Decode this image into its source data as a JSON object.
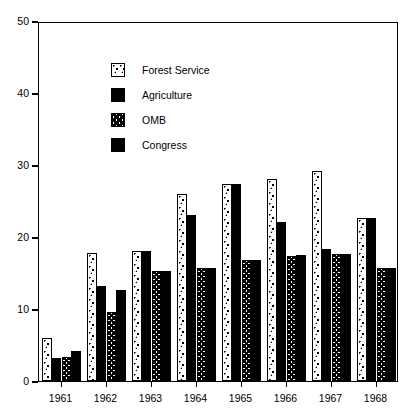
{
  "chart_data": {
    "type": "bar",
    "title": "",
    "xlabel": "",
    "ylabel": "Millions of Dollars",
    "categories": [
      "1961",
      "1962",
      "1963",
      "1964",
      "1965",
      "1966",
      "1967",
      "1968"
    ],
    "series": [
      {
        "name": "Forest Service",
        "pattern": "dots",
        "values": [
          6.0,
          17.8,
          18.0,
          26.0,
          27.4,
          28.0,
          29.2,
          22.7
        ]
      },
      {
        "name": "Agriculture",
        "pattern": "solid",
        "values": [
          3.2,
          13.2,
          18.0,
          23.0,
          27.4,
          22.1,
          18.3,
          22.7
        ]
      },
      {
        "name": "OMB",
        "pattern": "chevron",
        "values": [
          3.3,
          9.6,
          15.3,
          15.7,
          16.8,
          17.4,
          17.6,
          15.7
        ]
      },
      {
        "name": "Congress",
        "pattern": "solid",
        "values": [
          4.2,
          12.7,
          15.3,
          15.7,
          16.8,
          17.5,
          17.6,
          15.7
        ]
      }
    ],
    "ylim": [
      0,
      50
    ],
    "y_ticks": [
      0,
      10,
      20,
      30,
      40,
      50
    ],
    "y_tick_labels": [
      "0",
      "10",
      "20",
      "30",
      "40",
      "50"
    ],
    "grid": false,
    "legend_position": "upper-left",
    "colors": {
      "ink": "#000000",
      "background": "#ffffff"
    }
  },
  "legend": {
    "items": [
      {
        "label": "Forest Service"
      },
      {
        "label": "Agriculture"
      },
      {
        "label": "OMB"
      },
      {
        "label": "Congress"
      }
    ]
  }
}
